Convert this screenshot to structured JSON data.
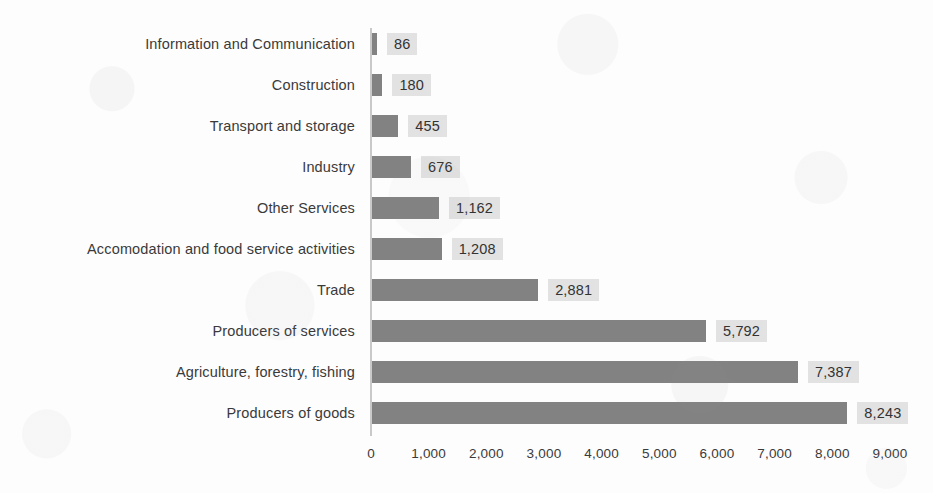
{
  "chart_data": {
    "type": "bar",
    "orientation": "horizontal",
    "title": "",
    "subtitle": "",
    "xlabel": "",
    "ylabel": "",
    "grid": false,
    "legend": false,
    "xlim": [
      0,
      9000
    ],
    "xticks": [
      0,
      1000,
      2000,
      3000,
      4000,
      5000,
      6000,
      7000,
      8000,
      9000
    ],
    "xtick_labels": [
      "0",
      "1,000",
      "2,000",
      "3,000",
      "4,000",
      "5,000",
      "6,000",
      "7,000",
      "8,000",
      "9,000"
    ],
    "categories": [
      "Information and Communication",
      "Construction",
      "Transport and storage",
      "Industry",
      "Other Services",
      "Accomodation and food service activities",
      "Trade",
      "Producers of services",
      "Agriculture, forestry, fishing",
      "Producers of goods"
    ],
    "values": [
      86,
      180,
      455,
      676,
      1162,
      1208,
      2881,
      5792,
      7387,
      8243
    ],
    "value_labels": [
      "86",
      "180",
      "455",
      "676",
      "1,162",
      "1,208",
      "2,881",
      "5,792",
      "7,387",
      "8,243"
    ],
    "colors": {
      "bar": "#828282",
      "value_label_background": "#e2e2e2",
      "axis_line": "#c9c9c9",
      "text": "#3a3a3a",
      "background": "#fdfdfd"
    }
  }
}
